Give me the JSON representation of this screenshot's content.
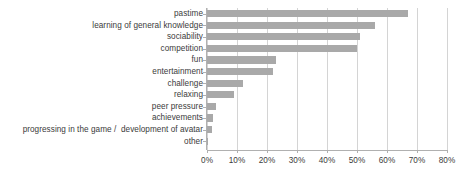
{
  "chart_data": {
    "type": "bar",
    "orientation": "horizontal",
    "title": "",
    "subtitle": "",
    "xlabel": "",
    "ylabel": "",
    "xlim": [
      0,
      80
    ],
    "xtick_step": 10,
    "xtick_labels": [
      "0%",
      "10%",
      "20%",
      "30%",
      "40%",
      "50%",
      "60%",
      "70%",
      "80%"
    ],
    "xtick_values": [
      0,
      10,
      20,
      30,
      40,
      50,
      60,
      70,
      80
    ],
    "grid": true,
    "legend": false,
    "legend_position": "none",
    "bar_color": "#a9a9a9",
    "gridline_color": "#d4d4d4",
    "axis_color": "#b0b0b0",
    "label_color": "#3b3b3b",
    "value_unit": "%",
    "categories": [
      "pastime",
      "learning of general knowledge",
      "sociability",
      "competition",
      "fun",
      "entertainment",
      "challenge",
      "relaxing",
      "peer pressure",
      "achievements",
      "progressing in the game /  development of avatar",
      "other"
    ],
    "values": [
      67,
      56,
      51,
      50,
      23,
      22,
      12,
      9,
      3,
      2,
      1.5,
      0.3
    ]
  }
}
